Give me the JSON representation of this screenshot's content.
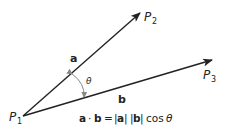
{
  "diagram": {
    "points": {
      "p1": {
        "label": "P",
        "sub": "1"
      },
      "p2": {
        "label": "P",
        "sub": "2"
      },
      "p3": {
        "label": "P",
        "sub": "3"
      }
    },
    "vectors": {
      "a": {
        "label": "a"
      },
      "b": {
        "label": "b"
      }
    },
    "angle_label": "θ",
    "formula": {
      "lhs_a": "a",
      "dot": "·",
      "lhs_b": "b",
      "eq": "=",
      "abs_a_open": "|",
      "abs_a": "a",
      "abs_a_close": "|",
      "abs_b_open": "|",
      "abs_b": "b",
      "abs_b_close": "|",
      "cos": "cos",
      "theta": "θ"
    },
    "colors": {
      "line": "#222222",
      "arc": "#888888"
    }
  }
}
